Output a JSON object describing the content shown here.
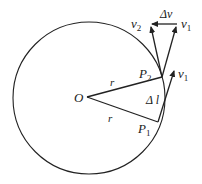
{
  "diagram": {
    "labels": {
      "center": "O",
      "radius_upper": "r",
      "radius_lower": "r",
      "point1": "P",
      "point1_sub": "1",
      "point2": "P",
      "point2_sub": "2",
      "arc": "Δ l",
      "v1_at_P1": "v",
      "v1_at_P1_sub": "1",
      "v2": "v",
      "v2_sub": "2",
      "v1_top": "v",
      "v1_top_sub": "1",
      "delta_v": "Δv"
    },
    "colors": {
      "stroke": "#222222",
      "background": "#ffffff"
    }
  }
}
